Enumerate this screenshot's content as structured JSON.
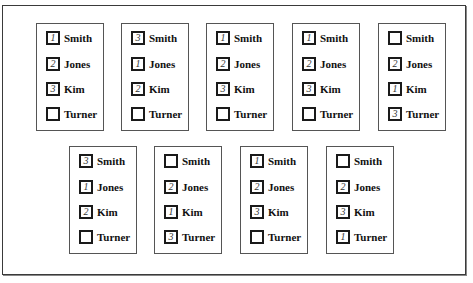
{
  "figure": {
    "candidates": [
      "Smith",
      "Jones",
      "Kim",
      "Turner"
    ]
  },
  "ballots": [
    {
      "position": {
        "left": 36,
        "top": 23
      },
      "rows": [
        {
          "candidate": "Smith",
          "rank": "1"
        },
        {
          "candidate": "Jones",
          "rank": "2"
        },
        {
          "candidate": "Kim",
          "rank": "3"
        },
        {
          "candidate": "Turner",
          "rank": ""
        }
      ]
    },
    {
      "position": {
        "left": 121,
        "top": 23
      },
      "rows": [
        {
          "candidate": "Smith",
          "rank": "3"
        },
        {
          "candidate": "Jones",
          "rank": "1"
        },
        {
          "candidate": "Kim",
          "rank": "2"
        },
        {
          "candidate": "Turner",
          "rank": ""
        }
      ]
    },
    {
      "position": {
        "left": 206,
        "top": 23
      },
      "rows": [
        {
          "candidate": "Smith",
          "rank": "1"
        },
        {
          "candidate": "Jones",
          "rank": "2"
        },
        {
          "candidate": "Kim",
          "rank": "3"
        },
        {
          "candidate": "Turner",
          "rank": ""
        }
      ]
    },
    {
      "position": {
        "left": 292,
        "top": 23
      },
      "rows": [
        {
          "candidate": "Smith",
          "rank": "1"
        },
        {
          "candidate": "Jones",
          "rank": "2"
        },
        {
          "candidate": "Kim",
          "rank": "3"
        },
        {
          "candidate": "Turner",
          "rank": ""
        }
      ]
    },
    {
      "position": {
        "left": 378,
        "top": 23
      },
      "rows": [
        {
          "candidate": "Smith",
          "rank": ""
        },
        {
          "candidate": "Jones",
          "rank": "2"
        },
        {
          "candidate": "Kim",
          "rank": "1"
        },
        {
          "candidate": "Turner",
          "rank": "3"
        }
      ]
    },
    {
      "position": {
        "left": 69,
        "top": 146
      },
      "rows": [
        {
          "candidate": "Smith",
          "rank": "3"
        },
        {
          "candidate": "Jones",
          "rank": "1"
        },
        {
          "candidate": "Kim",
          "rank": "2"
        },
        {
          "candidate": "Turner",
          "rank": ""
        }
      ]
    },
    {
      "position": {
        "left": 154,
        "top": 146
      },
      "rows": [
        {
          "candidate": "Smith",
          "rank": ""
        },
        {
          "candidate": "Jones",
          "rank": "2"
        },
        {
          "candidate": "Kim",
          "rank": "1"
        },
        {
          "candidate": "Turner",
          "rank": "3"
        }
      ]
    },
    {
      "position": {
        "left": 240,
        "top": 146
      },
      "rows": [
        {
          "candidate": "Smith",
          "rank": "1"
        },
        {
          "candidate": "Jones",
          "rank": "2"
        },
        {
          "candidate": "Kim",
          "rank": "3"
        },
        {
          "candidate": "Turner",
          "rank": ""
        }
      ]
    },
    {
      "position": {
        "left": 326,
        "top": 146
      },
      "rows": [
        {
          "candidate": "Smith",
          "rank": ""
        },
        {
          "candidate": "Jones",
          "rank": "2"
        },
        {
          "candidate": "Kim",
          "rank": "3"
        },
        {
          "candidate": "Turner",
          "rank": "1"
        }
      ]
    }
  ]
}
